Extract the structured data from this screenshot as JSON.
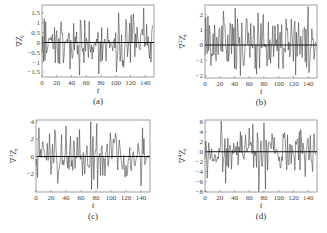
{
  "chart_data": [
    {
      "type": "line",
      "panel": "a",
      "caption": "(a)",
      "xlabel": "t",
      "ylabel": "∇Z_t",
      "ylabel_base": "∇",
      "ylabel_exp": "",
      "xlim": [
        0,
        152
      ],
      "ylim": [
        -1.75,
        1.9
      ],
      "xticks": [
        0,
        20,
        40,
        60,
        80,
        100,
        120,
        140
      ],
      "yticks": [
        -1.5,
        -1,
        -0.5,
        0,
        0.5,
        1,
        1.5
      ],
      "ytick_labels": [
        "−1.5",
        "−1",
        "−0.5",
        "0",
        "0.5",
        "1",
        "1.5"
      ],
      "frame": {
        "x": 42,
        "y": 5,
        "w": 112,
        "h": 72
      },
      "amplitude": 1.6,
      "seed": 11,
      "peaks": [
        [
          3,
          1.2
        ],
        [
          5,
          1.05
        ],
        [
          26,
          1.05
        ],
        [
          38,
          -1.35
        ],
        [
          51,
          -1.65
        ],
        [
          58,
          1.15
        ],
        [
          77,
          -1.6
        ],
        [
          101,
          -1.5
        ],
        [
          104,
          1.5
        ],
        [
          124,
          1.45
        ],
        [
          138,
          1.75
        ]
      ]
    },
    {
      "type": "line",
      "panel": "b",
      "caption": "(b)",
      "xlabel": "t",
      "ylabel": "∇²Z_t",
      "ylabel_base": "∇",
      "ylabel_exp": "2",
      "xlim": [
        0,
        152
      ],
      "ylim": [
        -2.15,
        2.6
      ],
      "xticks": [
        0,
        20,
        40,
        60,
        80,
        100,
        120,
        140
      ],
      "yticks": [
        -2,
        -1,
        0,
        1,
        2
      ],
      "ytick_labels": [
        "−2",
        "−1",
        "0",
        "1",
        "2"
      ],
      "frame": {
        "x": 205,
        "y": 5,
        "w": 112,
        "h": 73
      },
      "amplitude": 2.3,
      "seed": 23,
      "peaks": [
        [
          1,
          1.8
        ],
        [
          4,
          1.9
        ],
        [
          25,
          2.2
        ],
        [
          41,
          2.4
        ],
        [
          48,
          -2.0
        ],
        [
          57,
          1.7
        ],
        [
          70,
          -1.9
        ],
        [
          72,
          2.1
        ],
        [
          79,
          2.0
        ],
        [
          140,
          2.5
        ],
        [
          141,
          -1.8
        ]
      ]
    },
    {
      "type": "line",
      "panel": "c",
      "caption": "(c)",
      "xlabel": "t",
      "ylabel": "∇³Z_t",
      "ylabel_base": "∇",
      "ylabel_exp": "3",
      "xlim": [
        0,
        152
      ],
      "ylim": [
        -4.1,
        4.2
      ],
      "xticks": [
        0,
        20,
        40,
        60,
        80,
        100,
        120,
        140
      ],
      "yticks": [
        -2,
        0,
        2,
        4
      ],
      "ytick_labels": [
        "−2",
        "0",
        "2",
        "4"
      ],
      "frame": {
        "x": 36,
        "y": 120,
        "w": 114,
        "h": 72
      },
      "amplitude": 3.6,
      "seed": 37,
      "peaks": [
        [
          4,
          3.3
        ],
        [
          25,
          3.1
        ],
        [
          29,
          -3.1
        ],
        [
          40,
          3.5
        ],
        [
          58,
          3.1
        ],
        [
          73,
          4.0
        ],
        [
          74,
          -3.8
        ],
        [
          81,
          3.8
        ],
        [
          82,
          -3.7
        ],
        [
          140,
          -3.4
        ],
        [
          142,
          3.3
        ]
      ]
    },
    {
      "type": "line",
      "panel": "d",
      "caption": "(d)",
      "xlabel": "t",
      "ylabel": "∇⁴Z_t",
      "ylabel_base": "∇",
      "ylabel_exp": "4",
      "xlim": [
        0,
        152
      ],
      "ylim": [
        -8.1,
        6.4
      ],
      "xticks": [
        0,
        20,
        40,
        60,
        80,
        100,
        120,
        140
      ],
      "yticks": [
        -8,
        -6,
        -4,
        -2,
        0,
        2,
        4,
        6
      ],
      "ytick_labels": [
        "−8",
        "−6",
        "−4",
        "−2",
        "0",
        "2",
        "4",
        "6"
      ],
      "frame": {
        "x": 205,
        "y": 120,
        "w": 112,
        "h": 72
      },
      "amplitude": 5.5,
      "seed": 53,
      "peaks": [
        [
          3,
          -5.3
        ],
        [
          22,
          6.2
        ],
        [
          28,
          -6.3
        ],
        [
          60,
          4.8
        ],
        [
          65,
          5.6
        ],
        [
          73,
          -8.0
        ],
        [
          80,
          5.8
        ],
        [
          82,
          -7.5
        ],
        [
          130,
          4.5
        ],
        [
          136,
          -5.0
        ]
      ]
    }
  ]
}
